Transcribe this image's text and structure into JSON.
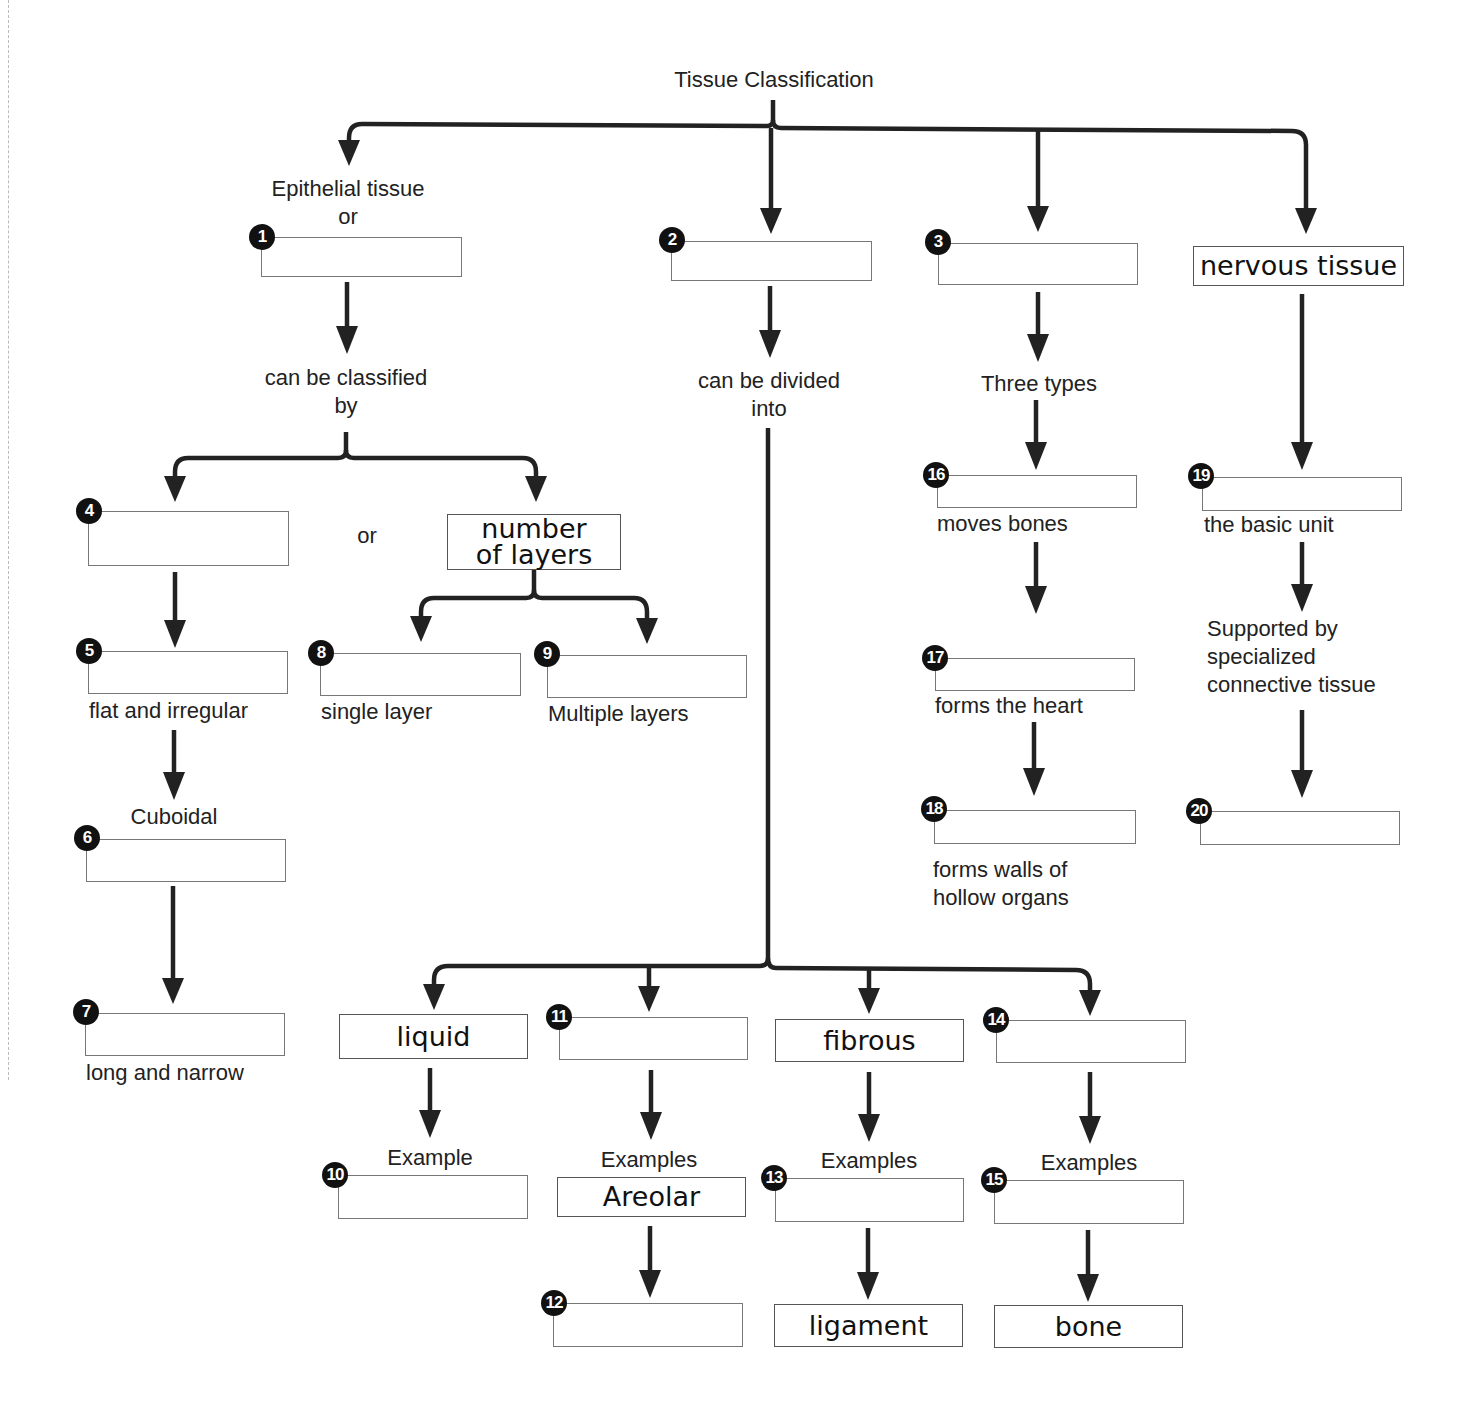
{
  "title": "Tissue Classification",
  "branches": {
    "epithelial": {
      "heading": "Epithelial tissue",
      "heading_or": "or",
      "box_number": "1",
      "connector": "can be classified",
      "connector2": "by",
      "or_label": "or",
      "number_of_layers": "number of layers",
      "shape_branch": [
        {
          "number": "4",
          "label": ""
        },
        {
          "number": "5",
          "label": "flat and irregular"
        },
        {
          "number": "6",
          "label_above": "Cuboidal"
        },
        {
          "number": "7",
          "label": "long and narrow"
        }
      ],
      "layer_branch": [
        {
          "number": "8",
          "label": "single layer"
        },
        {
          "number": "9",
          "label": "Multiple layers"
        }
      ]
    },
    "connective": {
      "box_number": "2",
      "connector": "can be divided",
      "connector2": "into",
      "types": [
        {
          "filled": "liquid",
          "example_label": "Example",
          "example_number": "10"
        },
        {
          "number": "11",
          "example_label": "Examples",
          "example_filled": "Areolar",
          "sub_number": "12"
        },
        {
          "filled": "fibrous",
          "example_label": "Examples",
          "example_number": "13",
          "sub_filled": "ligament"
        },
        {
          "number": "14",
          "example_label": "Examples",
          "example_number": "15",
          "sub_filled": "bone"
        }
      ]
    },
    "muscle": {
      "box_number": "3",
      "connector": "Three types",
      "items": [
        {
          "number": "16",
          "label": "moves bones"
        },
        {
          "number": "17",
          "label": "forms the heart"
        },
        {
          "number": "18",
          "label_line1": "forms walls of",
          "label_line2": "hollow organs"
        }
      ]
    },
    "nervous": {
      "filled": "nervous tissue",
      "items": [
        {
          "number": "19",
          "label": "the basic unit"
        },
        {
          "label_line1": "Supported by",
          "label_line2": "specialized",
          "label_line3": "connective tissue"
        },
        {
          "number": "20"
        }
      ]
    }
  }
}
